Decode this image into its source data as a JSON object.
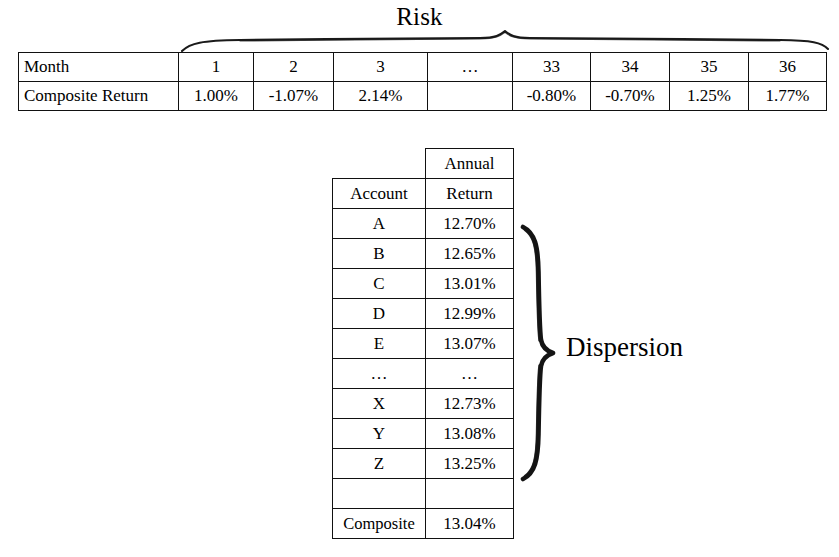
{
  "annotations": {
    "risk": {
      "label": "Risk",
      "brace_icon": "horizontal-curly-brace-icon"
    },
    "dispersion": {
      "label": "Dispersion",
      "brace_icon": "vertical-curly-brace-icon"
    }
  },
  "monthly_table": {
    "rows": [
      {
        "header": "Month",
        "cells": [
          "1",
          "2",
          "3",
          "…",
          "33",
          "34",
          "35",
          "36"
        ]
      },
      {
        "header": "Composite Return",
        "cells": [
          "1.00%",
          "-1.07%",
          "2.14%",
          "",
          "-0.80%",
          "-0.70%",
          "1.25%",
          "1.77%"
        ]
      }
    ]
  },
  "account_table": {
    "header": {
      "col1": "Account",
      "col2_line1": "Annual",
      "col2_line2": "Return"
    },
    "rows": [
      {
        "account": "A",
        "annual_return": "12.70%"
      },
      {
        "account": "B",
        "annual_return": "12.65%"
      },
      {
        "account": "C",
        "annual_return": "13.01%"
      },
      {
        "account": "D",
        "annual_return": "12.99%"
      },
      {
        "account": "E",
        "annual_return": "13.07%"
      },
      {
        "account": "…",
        "annual_return": "…"
      },
      {
        "account": "X",
        "annual_return": "12.73%"
      },
      {
        "account": "Y",
        "annual_return": "13.08%"
      },
      {
        "account": "Z",
        "annual_return": "13.25%"
      },
      {
        "account": "",
        "annual_return": ""
      }
    ],
    "footer": {
      "account": "Composite",
      "annual_return": "13.04%"
    }
  },
  "colors": {
    "ink": "#111111",
    "background": "#ffffff"
  }
}
